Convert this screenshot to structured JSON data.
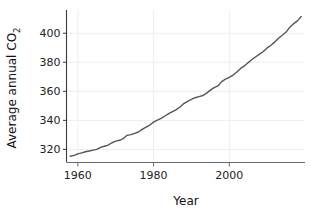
{
  "chart_data": {
    "type": "line",
    "title": "",
    "xlabel": "Year",
    "ylabel": "Average annual CO2",
    "ylabel_base": "Average annual CO",
    "ylabel_subscript": "2",
    "xlim": [
      1957,
      2020
    ],
    "ylim": [
      311,
      416
    ],
    "xticks": [
      1960,
      1980,
      2000
    ],
    "xticklabels": [
      "1960",
      "1980",
      "2000"
    ],
    "yticks": [
      320,
      340,
      360,
      380,
      400
    ],
    "yticklabels": [
      "320",
      "340",
      "360",
      "380",
      "400"
    ],
    "grid": true,
    "grid_color": "#eeeeee",
    "legend": null,
    "line_color": "#555555",
    "line_width": 1.4,
    "series": [
      {
        "name": "Average annual CO2",
        "x": [
          1958,
          1959,
          1960,
          1961,
          1962,
          1963,
          1964,
          1965,
          1966,
          1967,
          1968,
          1969,
          1970,
          1971,
          1972,
          1973,
          1974,
          1975,
          1976,
          1977,
          1978,
          1979,
          1980,
          1981,
          1982,
          1983,
          1984,
          1985,
          1986,
          1987,
          1988,
          1989,
          1990,
          1991,
          1992,
          1993,
          1994,
          1995,
          1996,
          1997,
          1998,
          1999,
          2000,
          2001,
          2002,
          2003,
          2004,
          2005,
          2006,
          2007,
          2008,
          2009,
          2010,
          2011,
          2012,
          2013,
          2014,
          2015,
          2016,
          2017,
          2018,
          2019
        ],
        "values": [
          315.3,
          315.9,
          316.9,
          317.6,
          318.4,
          318.9,
          319.5,
          320.0,
          321.4,
          322.2,
          323.0,
          324.6,
          325.7,
          326.3,
          327.5,
          329.7,
          330.2,
          331.1,
          332.0,
          333.8,
          335.4,
          336.8,
          338.8,
          340.1,
          341.4,
          343.0,
          344.6,
          346.0,
          347.4,
          349.2,
          351.6,
          353.1,
          354.4,
          355.6,
          356.4,
          357.1,
          358.8,
          360.8,
          362.6,
          363.7,
          366.7,
          368.4,
          369.6,
          371.2,
          373.3,
          375.8,
          377.5,
          379.8,
          381.9,
          383.8,
          385.6,
          387.4,
          389.9,
          391.7,
          393.9,
          396.5,
          398.6,
          400.8,
          404.2,
          406.6,
          408.5,
          411.5
        ]
      }
    ]
  },
  "figure": {
    "xlabel_text": "Year",
    "ylabel_text": "Average annual CO",
    "ylabel_sub": "2"
  }
}
